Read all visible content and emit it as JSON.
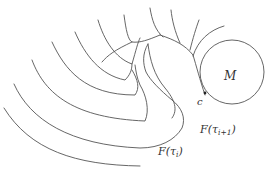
{
  "diagram": {
    "type": "level-set illustration",
    "labels": {
      "manifold": "M",
      "contact_point": "c",
      "level_i": "F(τ",
      "level_i_sub": "i",
      "level_i_close": ")",
      "level_i1": "F(τ",
      "level_i1_sub": "i+1",
      "level_i1_close": ")"
    },
    "colors": {
      "stroke": "#555555",
      "text": "#333333",
      "background": "#ffffff"
    }
  }
}
